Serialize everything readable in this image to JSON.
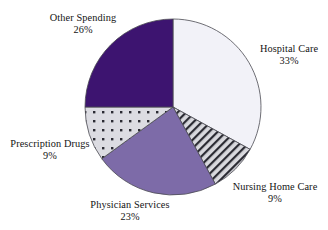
{
  "figure": {
    "background_color": "#ffffff",
    "text_color": "#141414",
    "outline_color": "#4a4a52"
  },
  "chart_data": {
    "type": "pie",
    "title": "",
    "subtitle": "",
    "xlabel": "",
    "ylabel": "",
    "legend_position": "none",
    "labels_position": "outside",
    "grid": false,
    "units": "percent",
    "total": 100,
    "start_angle_deg": 0,
    "direction": "clockwise",
    "categories": [
      "Hospital Care",
      "Nursing Home Care",
      "Physician Services",
      "Prescription Drugs",
      "Other Spending"
    ],
    "values": [
      33,
      9,
      23,
      9,
      26
    ],
    "slices": [
      {
        "label": "Hospital Care",
        "value": 33,
        "value_text": "33%",
        "fill": "#f2f2f8",
        "pattern": "solid",
        "start_deg": 0,
        "end_deg": 118.8
      },
      {
        "label": "Nursing Home Care",
        "value": 9,
        "value_text": "9%",
        "fill": "#d9d9de",
        "pattern": "diagonal-hatch",
        "pattern_color": "#2b2b33",
        "start_deg": 118.8,
        "end_deg": 151.2
      },
      {
        "label": "Physician Services",
        "value": 23,
        "value_text": "23%",
        "fill": "#7d6ba8",
        "pattern": "solid",
        "start_deg": 151.2,
        "end_deg": 234.0
      },
      {
        "label": "Prescription Drugs",
        "value": 9,
        "value_text": "9%",
        "fill": "#dcdce2",
        "pattern": "square-dots",
        "pattern_color": "#2b2b33",
        "start_deg": 234.0,
        "end_deg": 270.0
      },
      {
        "label": "Other Spending",
        "value": 26,
        "value_text": "26%",
        "fill": "#3d1470",
        "pattern": "solid",
        "start_deg": 270.0,
        "end_deg": 360.0
      }
    ],
    "geometry": {
      "center_x": 173,
      "center_y": 107,
      "radius": 88
    }
  },
  "labels": {
    "hospital_care": {
      "name": "Hospital Care",
      "percent": "33%"
    },
    "nursing_home_care": {
      "name": "Nursing Home Care",
      "percent": "9%"
    },
    "physician_services": {
      "name": "Physician Services",
      "percent": "23%"
    },
    "prescription_drugs": {
      "name": "Prescription Drugs",
      "percent": "9%"
    },
    "other_spending": {
      "name": "Other Spending",
      "percent": "26%"
    }
  }
}
